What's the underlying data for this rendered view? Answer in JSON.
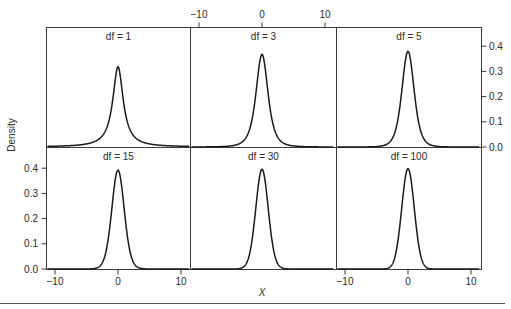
{
  "chart_data": {
    "type": "line",
    "title": "",
    "xlabel": "X",
    "ylabel": "Density",
    "xlim": [
      -11.5,
      11.5
    ],
    "ylim": [
      0.0,
      0.47
    ],
    "x_ticks": [
      -10,
      0,
      10
    ],
    "y_ticks": [
      0.0,
      0.1,
      0.2,
      0.3,
      0.4
    ],
    "y_tick_labels": [
      "0.0",
      "0.1",
      "0.2",
      "0.3",
      "0.4"
    ],
    "x_tick_labels": [
      "−10",
      "0",
      "10"
    ],
    "grid": false,
    "legend": null,
    "layout": {
      "rows": 2,
      "cols": 3
    },
    "panels": [
      {
        "label": "df = 1",
        "df": 1,
        "peak": 0.318,
        "row": 0,
        "col": 0
      },
      {
        "label": "df = 3",
        "df": 3,
        "peak": 0.368,
        "row": 0,
        "col": 1
      },
      {
        "label": "df = 5",
        "df": 5,
        "peak": 0.38,
        "row": 0,
        "col": 2
      },
      {
        "label": "df = 15",
        "df": 15,
        "peak": 0.393,
        "row": 1,
        "col": 0
      },
      {
        "label": "df = 30",
        "df": 30,
        "peak": 0.396,
        "row": 1,
        "col": 1
      },
      {
        "label": "df = 100",
        "df": 100,
        "peak": 0.398,
        "row": 1,
        "col": 2
      }
    ],
    "axes_placement": {
      "top_x_axis": "middle column",
      "bottom_x_axis": "left and right columns",
      "right_y_axis": "top row",
      "left_y_axis": "bottom row"
    }
  },
  "labels": {
    "ylabel": "Density",
    "xlabel": "X"
  },
  "colors": {
    "line": "#1a1a1a",
    "frame": "#3a3a3a",
    "text": "#2a2a2a",
    "background": "#ffffff"
  }
}
